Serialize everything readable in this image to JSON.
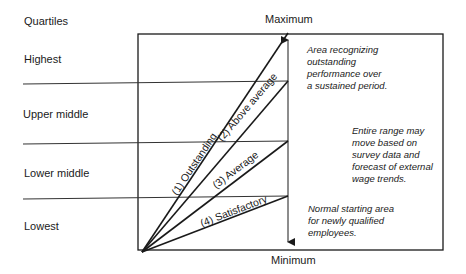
{
  "diagram": {
    "left_header": "Quartiles",
    "quartiles": [
      {
        "label": "Highest"
      },
      {
        "label": "Upper middle"
      },
      {
        "label": "Lower middle"
      },
      {
        "label": "Lowest"
      }
    ],
    "range_top_label": "Maximum",
    "range_bottom_label": "Minimum",
    "performance_lines": [
      {
        "label": "(1) Outstanding"
      },
      {
        "label": "(2) Above average"
      },
      {
        "label": "(3) Average"
      },
      {
        "label": "(4) Satisfactory"
      }
    ],
    "notes": {
      "top": "Area recognizing\noutstanding\nperformance over\na sustained period.",
      "middle": "Entire range may\nmove based on\nsurvey data and\nforecast of external\nwage trends.",
      "bottom": "Normal starting area\nfor newly qualified\nemployees."
    },
    "line_color": "#1a1a1a"
  }
}
